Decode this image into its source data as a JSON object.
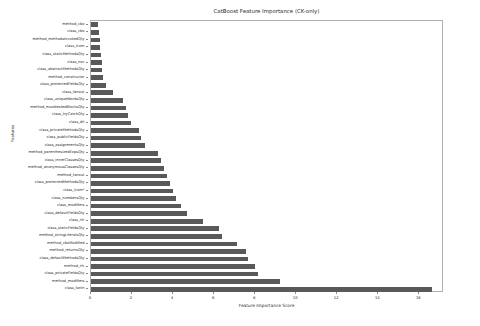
{
  "chart_data": {
    "type": "bar",
    "orientation": "horizontal",
    "title": "CatBoost Feature Importance (CK-only)",
    "xlabel": "Feature Importance Score",
    "ylabel": "Features",
    "xlim": [
      0,
      17.2
    ],
    "ylim": [
      0,
      37
    ],
    "grid": false,
    "legend": null,
    "bar_color": "#595959",
    "xticks": [
      0,
      2,
      4,
      6,
      8,
      10,
      12,
      14,
      16
    ],
    "xtick_labels": [
      "0",
      "2",
      "4",
      "6",
      "8",
      "10",
      "12",
      "14",
      "16"
    ],
    "categories": [
      "method_cbo",
      "class_cbo",
      "method_methodsInvokedQty",
      "class_lcom",
      "class_staticMethodsQty",
      "class_noc",
      "class_abstractMethodsQty",
      "method_constructor",
      "class_protectedFieldsQty",
      "class_fanout",
      "class_uniqueWordsQty",
      "method_maxNestedBlocksQty",
      "class_tryCatchQty",
      "class_dit",
      "class_privateMethodsQty",
      "class_publicFieldsQty",
      "class_assignmentsQty",
      "method_parenthesizedExpsQty",
      "class_innerClassesQty",
      "method_anonymousClassesQty",
      "method_fanout",
      "class_protectedMethodsQty",
      "class_lcom*",
      "class_numbersQty",
      "class_modifiers",
      "class_defaultFieldsQty",
      "class_rfc",
      "class_staticFieldsQty",
      "method_stringLiteralsQty",
      "method_cboModified",
      "method_returnsQty",
      "class_defaultMethodsQty",
      "method_rfc",
      "class_privateFieldsQty",
      "method_modifiers",
      "class_fanin"
    ],
    "values": [
      0.35,
      0.38,
      0.42,
      0.45,
      0.48,
      0.52,
      0.55,
      0.6,
      0.72,
      1.05,
      1.55,
      1.7,
      1.8,
      1.95,
      2.35,
      2.45,
      2.65,
      3.25,
      3.4,
      3.55,
      3.7,
      3.85,
      4.0,
      4.15,
      4.4,
      4.7,
      5.45,
      6.25,
      6.4,
      7.1,
      7.55,
      7.65,
      8.0,
      8.15,
      9.2,
      16.6
    ]
  }
}
